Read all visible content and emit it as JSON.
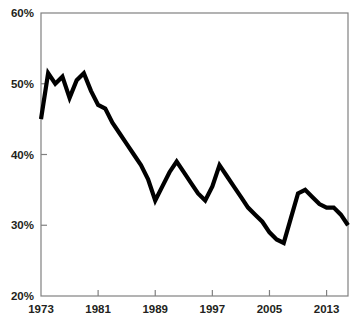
{
  "chart_data": {
    "type": "line",
    "title": "",
    "subtitle": "",
    "xlabel": "",
    "ylabel": "",
    "xlim": [
      1973,
      2016
    ],
    "ylim": [
      20,
      60
    ],
    "grid": false,
    "legend": false,
    "legend_position": "none",
    "line_color": "#000000",
    "axis_color": "#808080",
    "background_color": "#ffffff",
    "y_tick_labels": [
      "60%",
      "50%",
      "40%",
      "30%",
      "20%"
    ],
    "y_tick_values": [
      60,
      50,
      40,
      30,
      20
    ],
    "x_tick_labels": [
      "1973",
      "1981",
      "1989",
      "1997",
      "2005",
      "2013"
    ],
    "x_tick_values": [
      1973,
      1981,
      1989,
      1997,
      2005,
      2013
    ],
    "series": [
      {
        "name": "value",
        "x": [
          1973,
          1974,
          1975,
          1976,
          1977,
          1978,
          1979,
          1980,
          1981,
          1982,
          1983,
          1984,
          1985,
          1986,
          1987,
          1988,
          1989,
          1990,
          1991,
          1992,
          1993,
          1994,
          1995,
          1996,
          1997,
          1998,
          1999,
          2000,
          2001,
          2002,
          2003,
          2004,
          2005,
          2006,
          2007,
          2008,
          2009,
          2010,
          2011,
          2012,
          2013,
          2014,
          2015,
          2016
        ],
        "values": [
          45.0,
          51.5,
          50.0,
          51.0,
          48.0,
          50.5,
          51.5,
          49.0,
          47.0,
          46.5,
          44.5,
          43.0,
          41.5,
          40.0,
          38.5,
          36.5,
          33.5,
          35.5,
          37.5,
          39.0,
          37.5,
          36.0,
          34.5,
          33.5,
          35.5,
          38.5,
          37.0,
          35.5,
          34.0,
          32.5,
          31.5,
          30.5,
          29.0,
          28.0,
          27.5,
          31.0,
          34.5,
          35.0,
          34.0,
          33.0,
          32.5,
          32.5,
          31.5,
          30.0
        ]
      }
    ]
  },
  "axes": {
    "y_axis_name": "percentage-axis",
    "x_axis_name": "year-axis"
  }
}
